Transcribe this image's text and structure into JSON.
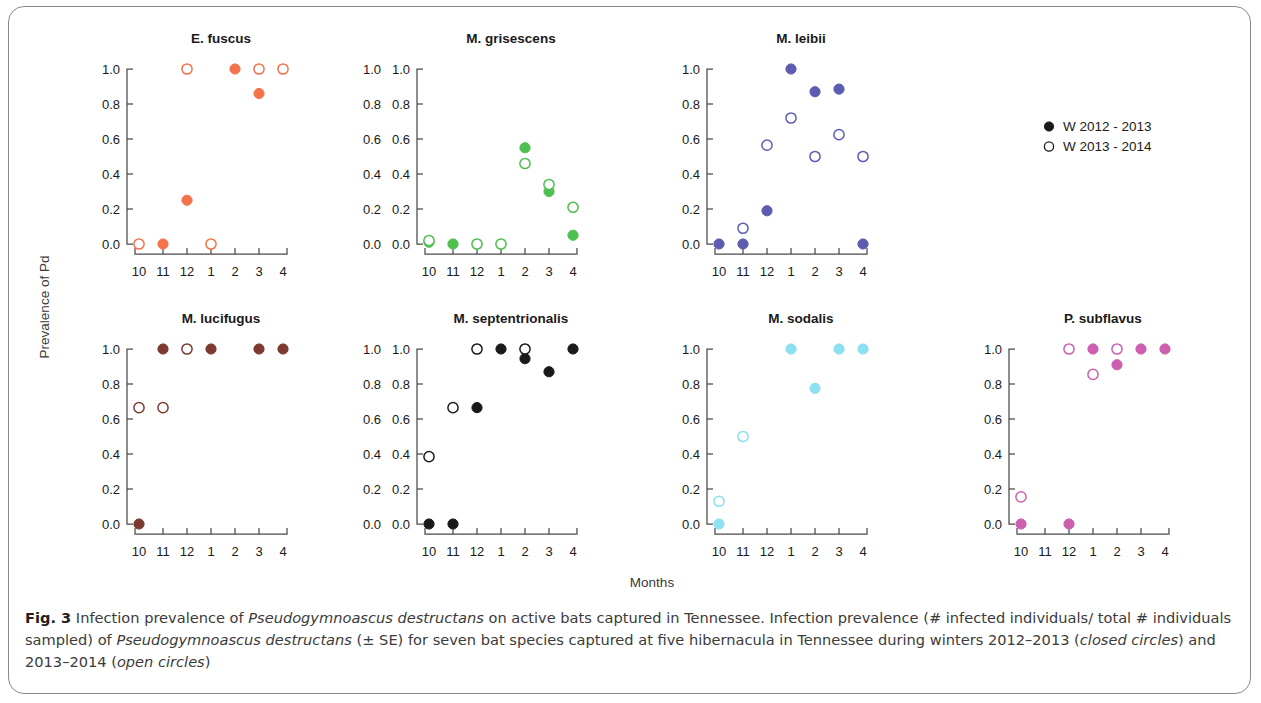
{
  "figure": {
    "ylabel": "Prevalence of Pd",
    "xlabel": "Months",
    "months": [
      "10",
      "11",
      "12",
      "1",
      "2",
      "3",
      "4"
    ],
    "yticks": [
      "0.0",
      "0.2",
      "0.4",
      "0.6",
      "0.8",
      "1.0"
    ]
  },
  "legend": {
    "items": [
      {
        "label": "W 2012 - 2013",
        "marker": "filled"
      },
      {
        "label": "W 2013 - 2014",
        "marker": "open"
      }
    ]
  },
  "caption": {
    "figno": "Fig. 3",
    "part1": " Infection prevalence of ",
    "species1": "Pseudogymnoascus destructans",
    "part2": " on active bats captured in Tennessee. Infection prevalence (# infected individuals/ total # individuals sampled) of ",
    "species2": "Pseudogymnoascus destructans",
    "part3": " (± SE) for seven bat species captured at five hibernacula in Tennessee during winters 2012–2013 (",
    "closed": "closed circles",
    "part4": ") and 2013–2014 (",
    "open": "open circles",
    "part5": ")"
  },
  "chart_data": {
    "type": "scatter",
    "title": "Infection prevalence of Pseudogymnoascus destructans on active bats captured in Tennessee",
    "xlabel": "Months",
    "ylabel": "Prevalence of Pd",
    "x": [
      "10",
      "11",
      "12",
      "1",
      "2",
      "3",
      "4"
    ],
    "ylim": [
      0.0,
      1.0
    ],
    "yticks": [
      0.0,
      0.2,
      0.4,
      0.6,
      0.8,
      1.0
    ],
    "grid": false,
    "legend_position": "center-right",
    "series_names": [
      "W 2012 - 2013",
      "W 2013 - 2014"
    ],
    "panels": [
      {
        "title": "E. fuscus",
        "color": "#F4734A",
        "row": 0,
        "col": 0,
        "show_right_axis": true,
        "series": [
          {
            "name": "W 2012 - 2013",
            "marker": "filled",
            "points": [
              {
                "month": "11",
                "value": 0.0
              },
              {
                "month": "12",
                "value": 0.25
              },
              {
                "month": "2",
                "value": 1.0
              },
              {
                "month": "3",
                "value": 0.86
              }
            ]
          },
          {
            "name": "W 2013 - 2014",
            "marker": "open",
            "points": [
              {
                "month": "10",
                "value": 0.0
              },
              {
                "month": "12",
                "value": 1.0
              },
              {
                "month": "1",
                "value": 0.0
              },
              {
                "month": "3",
                "value": 1.0
              },
              {
                "month": "4",
                "value": 1.0
              }
            ]
          }
        ]
      },
      {
        "title": "M. grisescens",
        "color": "#4FBF4F",
        "row": 0,
        "col": 1,
        "show_right_axis": false,
        "series": [
          {
            "name": "W 2012 - 2013",
            "marker": "filled",
            "points": [
              {
                "month": "10",
                "value": 0.01
              },
              {
                "month": "11",
                "value": 0.0
              },
              {
                "month": "2",
                "value": 0.55
              },
              {
                "month": "3",
                "value": 0.3
              },
              {
                "month": "4",
                "value": 0.05
              }
            ]
          },
          {
            "name": "W 2013 - 2014",
            "marker": "open",
            "points": [
              {
                "month": "10",
                "value": 0.02
              },
              {
                "month": "12",
                "value": 0.0
              },
              {
                "month": "1",
                "value": 0.0
              },
              {
                "month": "2",
                "value": 0.46
              },
              {
                "month": "3",
                "value": 0.34
              },
              {
                "month": "4",
                "value": 0.21
              }
            ]
          }
        ]
      },
      {
        "title": "M. leibii",
        "color": "#5C5CB0",
        "row": 0,
        "col": 2,
        "show_right_axis": false,
        "series": [
          {
            "name": "W 2012 - 2013",
            "marker": "filled",
            "points": [
              {
                "month": "10",
                "value": 0.0
              },
              {
                "month": "11",
                "value": 0.0
              },
              {
                "month": "12",
                "value": 0.19
              },
              {
                "month": "1",
                "value": 1.0
              },
              {
                "month": "2",
                "value": 0.87
              },
              {
                "month": "3",
                "value": 0.885
              },
              {
                "month": "4",
                "value": 0.0
              }
            ]
          },
          {
            "name": "W 2013 - 2014",
            "marker": "open",
            "points": [
              {
                "month": "11",
                "value": 0.09
              },
              {
                "month": "12",
                "value": 0.565
              },
              {
                "month": "1",
                "value": 0.72
              },
              {
                "month": "2",
                "value": 0.5
              },
              {
                "month": "3",
                "value": 0.625
              },
              {
                "month": "4",
                "value": 0.5
              }
            ]
          }
        ]
      },
      {
        "title": "M. lucifugus",
        "color": "#7C3A30",
        "row": 1,
        "col": 0,
        "show_right_axis": true,
        "series": [
          {
            "name": "W 2012 - 2013",
            "marker": "filled",
            "points": [
              {
                "month": "10",
                "value": 0.0
              },
              {
                "month": "11",
                "value": 1.0
              },
              {
                "month": "1",
                "value": 1.0
              },
              {
                "month": "3",
                "value": 1.0
              },
              {
                "month": "4",
                "value": 1.0
              }
            ]
          },
          {
            "name": "W 2013 - 2014",
            "marker": "open",
            "points": [
              {
                "month": "10",
                "value": 0.665
              },
              {
                "month": "11",
                "value": 0.665
              },
              {
                "month": "12",
                "value": 1.0
              }
            ]
          }
        ]
      },
      {
        "title": "M. septentrionalis",
        "color": "#1A1A1A",
        "row": 1,
        "col": 1,
        "show_right_axis": false,
        "series": [
          {
            "name": "W 2012 - 2013",
            "marker": "filled",
            "points": [
              {
                "month": "10",
                "value": 0.0
              },
              {
                "month": "11",
                "value": 0.0
              },
              {
                "month": "12",
                "value": 0.665
              },
              {
                "month": "1",
                "value": 1.0
              },
              {
                "month": "2",
                "value": 0.945
              },
              {
                "month": "3",
                "value": 0.87
              },
              {
                "month": "4",
                "value": 1.0
              }
            ]
          },
          {
            "name": "W 2013 - 2014",
            "marker": "open",
            "points": [
              {
                "month": "10",
                "value": 0.385
              },
              {
                "month": "11",
                "value": 0.665
              },
              {
                "month": "12",
                "value": 1.0
              },
              {
                "month": "2",
                "value": 1.0
              }
            ]
          }
        ]
      },
      {
        "title": "M. sodalis",
        "color": "#8CE0F2",
        "row": 1,
        "col": 2,
        "show_right_axis": false,
        "series": [
          {
            "name": "W 2012 - 2013",
            "marker": "filled",
            "points": [
              {
                "month": "10",
                "value": 0.0
              },
              {
                "month": "1",
                "value": 1.0
              },
              {
                "month": "2",
                "value": 0.775
              },
              {
                "month": "3",
                "value": 1.0
              },
              {
                "month": "4",
                "value": 1.0
              }
            ]
          },
          {
            "name": "W 2013 - 2014",
            "marker": "open",
            "points": [
              {
                "month": "10",
                "value": 0.13
              },
              {
                "month": "11",
                "value": 0.5
              }
            ]
          }
        ]
      },
      {
        "title": "P. subflavus",
        "color": "#CC5FAF",
        "row": 1,
        "col": 3,
        "show_right_axis": false,
        "series": [
          {
            "name": "W 2012 - 2013",
            "marker": "filled",
            "points": [
              {
                "month": "10",
                "value": 0.0
              },
              {
                "month": "12",
                "value": 0.0
              },
              {
                "month": "1",
                "value": 1.0
              },
              {
                "month": "2",
                "value": 0.91
              },
              {
                "month": "3",
                "value": 1.0
              },
              {
                "month": "4",
                "value": 1.0
              }
            ]
          },
          {
            "name": "W 2013 - 2014",
            "marker": "open",
            "points": [
              {
                "month": "10",
                "value": 0.155
              },
              {
                "month": "12",
                "value": 1.0
              },
              {
                "month": "1",
                "value": 0.855
              },
              {
                "month": "2",
                "value": 1.0
              }
            ]
          }
        ]
      }
    ]
  }
}
